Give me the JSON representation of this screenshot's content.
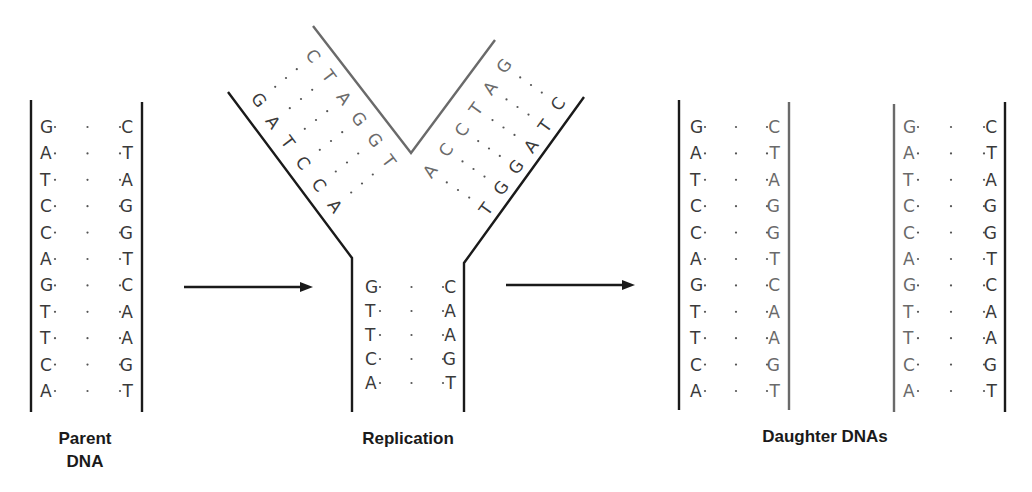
{
  "panels": {
    "parent": {
      "label_line1": "Parent",
      "label_line2": "DNA",
      "left_strand": [
        "G",
        "A",
        "T",
        "C",
        "C",
        "A",
        "G",
        "T",
        "T",
        "C",
        "A"
      ],
      "right_strand": [
        "C",
        "T",
        "A",
        "G",
        "G",
        "T",
        "C",
        "A",
        "A",
        "G",
        "T"
      ]
    },
    "replication": {
      "label": "Replication",
      "left_arm": {
        "outer_strand": [
          "G",
          "A",
          "T",
          "C",
          "C",
          "A"
        ],
        "new_strand": [
          "C",
          "T",
          "A",
          "G",
          "G",
          "T"
        ]
      },
      "right_arm": {
        "new_strand": [
          "G",
          "A",
          "T",
          "C",
          "C",
          "A"
        ],
        "outer_strand": [
          "C",
          "T",
          "A",
          "G",
          "G",
          "T"
        ]
      },
      "stem": {
        "left_strand": [
          "G",
          "T",
          "T",
          "C",
          "A"
        ],
        "right_strand": [
          "C",
          "A",
          "A",
          "G",
          "T"
        ]
      }
    },
    "daughters": {
      "label": "Daughter DNAs",
      "daughter1": {
        "left_strand": [
          "G",
          "A",
          "T",
          "C",
          "C",
          "A",
          "G",
          "T",
          "T",
          "C",
          "A"
        ],
        "right_strand": [
          "C",
          "T",
          "A",
          "G",
          "G",
          "T",
          "C",
          "A",
          "A",
          "G",
          "T"
        ]
      },
      "daughter2": {
        "left_strand": [
          "G",
          "A",
          "T",
          "C",
          "C",
          "A",
          "G",
          "T",
          "T",
          "C",
          "A"
        ],
        "right_strand": [
          "C",
          "T",
          "A",
          "G",
          "G",
          "T",
          "C",
          "A",
          "A",
          "G",
          "T"
        ]
      }
    }
  },
  "arrows": [
    {
      "name": "parent-to-replication-arrow",
      "icon": "right-arrow-icon"
    },
    {
      "name": "replication-to-daughters-arrow",
      "icon": "right-arrow-icon"
    }
  ],
  "colors": {
    "old_strand": "#1a1a1a",
    "new_strand": "#6a6a6a"
  }
}
